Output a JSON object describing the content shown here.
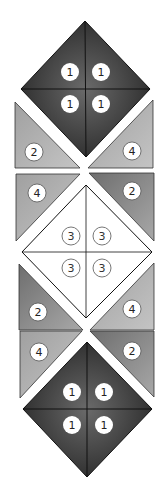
{
  "colors": {
    "background": "#ffffff",
    "dark_piece": "#2e2e2e",
    "dark_piece_highlight": "#6a6a6a",
    "light_gray_piece": "#b2b2b2",
    "mid_gray_piece": "#8c8c8c",
    "white_piece": "#ffffff",
    "outline": "#1a1a1a",
    "badge_fill": "#ffffff",
    "badge_text": "#222222",
    "badge_stroke_light": "#666666"
  },
  "pieces": {
    "top_diamond": {
      "label": "1",
      "quadrants": [
        {
          "position": "upper-left",
          "label": "1"
        },
        {
          "position": "upper-right",
          "label": "1"
        },
        {
          "position": "lower-left",
          "label": "1"
        },
        {
          "position": "lower-right",
          "label": "1"
        }
      ]
    },
    "row1_left_triangle": {
      "label": "2"
    },
    "row1_right_triangle": {
      "label": "4"
    },
    "row2_left_triangle": {
      "label": "4"
    },
    "row2_right_triangle": {
      "label": "2"
    },
    "middle_diamond": {
      "label": "3",
      "quadrants": [
        {
          "position": "upper-left",
          "label": "3"
        },
        {
          "position": "upper-right",
          "label": "3"
        },
        {
          "position": "lower-left",
          "label": "3"
        },
        {
          "position": "lower-right",
          "label": "3"
        }
      ]
    },
    "row3_left_triangle": {
      "label": "2"
    },
    "row3_right_triangle": {
      "label": "4"
    },
    "row4_left_triangle": {
      "label": "4"
    },
    "row4_right_triangle": {
      "label": "2"
    },
    "bottom_diamond": {
      "label": "1",
      "quadrants": [
        {
          "position": "upper-left",
          "label": "1"
        },
        {
          "position": "upper-right",
          "label": "1"
        },
        {
          "position": "lower-left",
          "label": "1"
        },
        {
          "position": "lower-right",
          "label": "1"
        }
      ]
    }
  }
}
